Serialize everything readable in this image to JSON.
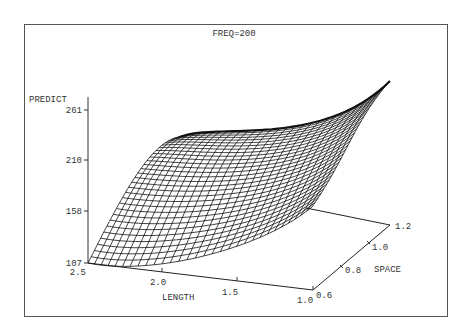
{
  "chart_data": {
    "type": "surface",
    "title": "FREQ=200",
    "zlabel": "PREDICT",
    "xlabel": "LENGTH",
    "ylabel": "SPACE",
    "z_ticks": [
      "261",
      "210",
      "158",
      "107"
    ],
    "z_range": [
      107,
      261
    ],
    "x_ticks": [
      "2.5",
      "2.0",
      "1.5",
      "1.0"
    ],
    "x_range": [
      1.0,
      2.5
    ],
    "y_ticks": [
      "0.6",
      "0.8",
      "1.0",
      "1.2"
    ],
    "y_range": [
      0.6,
      1.2
    ],
    "grid_lines": 30,
    "surface_description": "Wireframe response surface; minimum ~107 at LENGTH=2.5, SPACE=0.6; maximum above 261 at LENGTH=1.0, SPACE=1.2; ridge rising along high-SPACE edge, saddle-like dip near LENGTH≈1.9"
  }
}
